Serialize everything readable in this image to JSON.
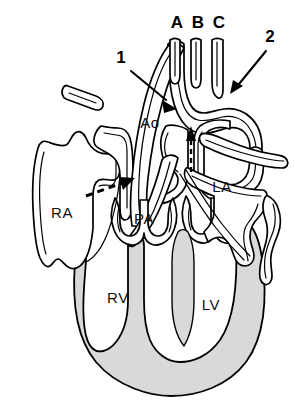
{
  "figure": {
    "background_color": "#ffffff",
    "line_color": "#000000",
    "myocardium_fill": "#d9d9d9",
    "width": 295,
    "height": 401
  },
  "chamber_labels": [
    {
      "id": "ra",
      "text": "RA",
      "x": 62,
      "y": 218,
      "name": "right atrium"
    },
    {
      "id": "rv",
      "text": "RV",
      "x": 118,
      "y": 303,
      "name": "right ventricle"
    },
    {
      "id": "pa",
      "text": "PA",
      "x": 144,
      "y": 224,
      "name": "pulmonary artery"
    },
    {
      "id": "la",
      "text": "LA",
      "x": 222,
      "y": 192,
      "name": "left atrium"
    },
    {
      "id": "lv",
      "text": "LV",
      "x": 211,
      "y": 310,
      "name": "left ventricle"
    },
    {
      "id": "ao",
      "text": "Ao",
      "x": 150,
      "y": 128,
      "name": "aorta"
    }
  ],
  "branch_labels": [
    {
      "id": "a",
      "text": "A",
      "x": 177,
      "y": 28
    },
    {
      "id": "b",
      "text": "B",
      "x": 198,
      "y": 28
    },
    {
      "id": "c",
      "text": "C",
      "x": 219,
      "y": 28
    }
  ],
  "callouts": [
    {
      "id": "callout-1",
      "text": "1",
      "label_x": 121,
      "label_y": 63,
      "target": "ascending aorta"
    },
    {
      "id": "callout-2",
      "text": "2",
      "label_x": 270,
      "label_y": 42,
      "target": "descending aorta"
    }
  ],
  "flow_arrows": [
    {
      "id": "septal-jet",
      "style": "dashed",
      "direction": "upward",
      "location": "aortic valve / outflow tract"
    },
    {
      "id": "shunt-arrow",
      "style": "dashed",
      "direction": "up-right",
      "location": "right atrium toward septum"
    }
  ]
}
